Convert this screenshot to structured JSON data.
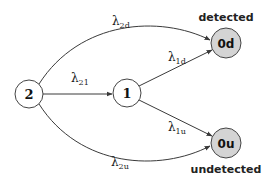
{
  "diagram": {
    "type": "state-transition",
    "nodes": [
      {
        "id": "2",
        "label": "2",
        "cx": 29,
        "cy": 94,
        "r": 14,
        "fill": "#ffffff"
      },
      {
        "id": "1",
        "label": "1",
        "cx": 127,
        "cy": 93,
        "r": 14,
        "fill": "#ffffff"
      },
      {
        "id": "0d",
        "label": "0d",
        "cx": 226,
        "cy": 43,
        "r": 15,
        "fill": "#d4d4d4"
      },
      {
        "id": "0u",
        "label": "0u",
        "cx": 226,
        "cy": 143,
        "r": 15,
        "fill": "#d4d4d4"
      }
    ],
    "captions": {
      "detected": "detected",
      "undetected": "undetected"
    },
    "edges": [
      {
        "from": "2",
        "to": "0d",
        "symbol": "λ",
        "sub": "2d"
      },
      {
        "from": "2",
        "to": "1",
        "symbol": "λ",
        "sub": "21"
      },
      {
        "from": "2",
        "to": "0u",
        "symbol": "λ",
        "sub": "2u"
      },
      {
        "from": "1",
        "to": "0d",
        "symbol": "λ",
        "sub": "1d"
      },
      {
        "from": "1",
        "to": "0u",
        "symbol": "λ",
        "sub": "1u"
      }
    ]
  }
}
